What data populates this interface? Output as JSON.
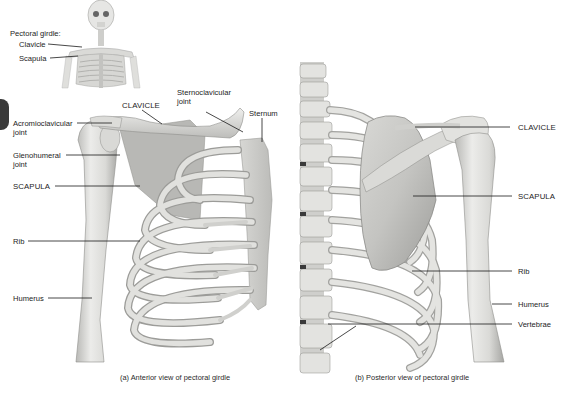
{
  "inset": {
    "title": "Pectoral girdle:",
    "items": [
      "Clavicle",
      "Scapula"
    ]
  },
  "anterior": {
    "labels": {
      "clavicle": "CLAVICLE",
      "sternoclavicular_joint_line1": "Sternoclavicular",
      "sternoclavicular_joint_line2": "joint",
      "sternum": "Sternum",
      "acromioclavicular_joint_line1": "Acromioclavicular",
      "acromioclavicular_joint_line2": "joint",
      "glenohumeral_joint_line1": "Glenohumeral",
      "glenohumeral_joint_line2": "joint",
      "scapula": "SCAPULA",
      "rib": "Rib",
      "humerus": "Humerus"
    },
    "caption": "(a) Anterior view of pectoral girdle"
  },
  "posterior": {
    "labels": {
      "clavicle": "CLAVICLE",
      "scapula": "SCAPULA",
      "rib": "Rib",
      "humerus": "Humerus",
      "vertebrae": "Vertebrae"
    },
    "caption": "(b) Posterior view of pectoral girdle"
  },
  "colors": {
    "bone_light": "#e9e9e7",
    "bone_mid": "#cfcfcc",
    "bone_shadow": "#a9a9a6",
    "leader_line": "#1a1a1a",
    "tab": "#3a3a3a"
  }
}
